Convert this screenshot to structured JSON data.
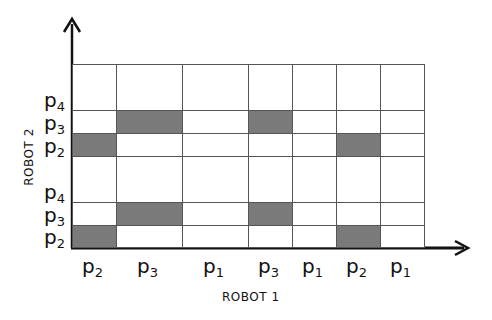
{
  "diagram": {
    "x_axis": {
      "title": "ROBOT 1",
      "labels": [
        {
          "base": "p",
          "sub": "2"
        },
        {
          "base": "p",
          "sub": "3"
        },
        {
          "base": "p",
          "sub": "1"
        },
        {
          "base": "p",
          "sub": "3"
        },
        {
          "base": "p",
          "sub": "1"
        },
        {
          "base": "p",
          "sub": "2"
        },
        {
          "base": "p",
          "sub": "1"
        }
      ]
    },
    "y_axis": {
      "title": "ROBOT 2",
      "labels_bottom_to_top": [
        {
          "base": "p",
          "sub": "2"
        },
        {
          "base": "p",
          "sub": "3"
        },
        {
          "base": "p",
          "sub": "4"
        },
        {
          "base": "p",
          "sub": "2"
        },
        {
          "base": "p",
          "sub": "3"
        },
        {
          "base": "p",
          "sub": "4"
        }
      ]
    },
    "grid": {
      "x_lines": [
        72,
        116,
        182,
        248,
        292,
        336,
        380,
        424
      ],
      "y_lines": [
        247,
        225,
        202,
        156,
        133,
        110,
        64
      ],
      "shaded_cells": [
        {
          "col": 0,
          "row": 0
        },
        {
          "col": 1,
          "row": 1
        },
        {
          "col": 3,
          "row": 1
        },
        {
          "col": 5,
          "row": 0
        },
        {
          "col": 0,
          "row": 3
        },
        {
          "col": 1,
          "row": 4
        },
        {
          "col": 3,
          "row": 4
        },
        {
          "col": 5,
          "row": 3
        }
      ]
    },
    "colors": {
      "line": "#555555",
      "shade": "#9a9a9a",
      "axis": "#111111"
    }
  }
}
